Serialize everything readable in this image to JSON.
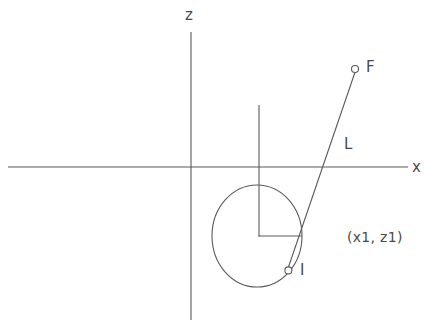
{
  "diagram": {
    "background_color": "#ffffff",
    "stroke_color": "#5a5a5a",
    "text_color": "#4a4a4a",
    "axes": {
      "z_label": "z",
      "x_label": "x",
      "z_axis": {
        "x": 191,
        "y_top": 32,
        "y_bottom": 320
      },
      "x_axis": {
        "y": 167,
        "x_left": 8,
        "x_right": 408
      },
      "origin": {
        "x": 191,
        "y": 167
      }
    },
    "circle": {
      "center_x": 257,
      "center_y": 236,
      "radius_x": 45,
      "radius_y": 51
    },
    "radius_markers": {
      "vertical": {
        "x": 259,
        "y_top": 105,
        "y_bottom": 236
      },
      "horizontal": {
        "y": 236,
        "x_left": 259,
        "x_right": 302
      }
    },
    "line_l": {
      "label": "L",
      "from_x": 355,
      "from_y": 69,
      "to_x": 288,
      "to_y": 270
    },
    "points": [
      {
        "name": "F",
        "label": "F",
        "x": 355,
        "y": 69,
        "radius": 3.5
      },
      {
        "name": "I",
        "label": "I",
        "x": 288,
        "y": 270,
        "radius": 3.5
      }
    ],
    "annotations": [
      {
        "name": "coordinates",
        "text": "(x1,  z1)"
      }
    ]
  }
}
